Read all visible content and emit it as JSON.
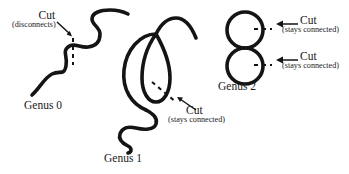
{
  "figure": {
    "width": 349,
    "height": 174,
    "background_color": "#ffffff",
    "ink_color": "#141414"
  },
  "annotations": {
    "cut_disconnects": {
      "main": "Cut",
      "sub": "(disconnects)"
    },
    "cut_genus1": {
      "main": "Cut",
      "sub": "(stays connected)"
    },
    "cut_genus2_top": {
      "main": "Cut",
      "sub": "(stays connected)"
    },
    "cut_genus2_bottom": {
      "main": "Cut",
      "sub": "(stays connected)"
    }
  },
  "shapes": {
    "genus0": {
      "label": "Genus 0",
      "description": "open wavy curve"
    },
    "genus1": {
      "label": "Genus 1",
      "description": "single loop with two tails"
    },
    "genus2": {
      "label": "Genus 2",
      "description": "two tangent circles, figure eight"
    }
  }
}
